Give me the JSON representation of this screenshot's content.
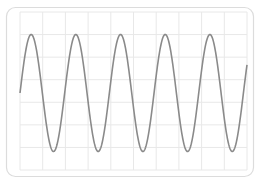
{
  "chart_data": {
    "type": "line",
    "title": "",
    "xlabel": "",
    "ylabel": "",
    "grid": true,
    "legend": null,
    "series": [
      {
        "name": "sine",
        "function": "sin",
        "cycles": 5.08,
        "amplitude": 1.0,
        "phase": 0
      }
    ],
    "xlim": [
      0,
      5.08
    ],
    "ylim": [
      -1.35,
      1.35
    ],
    "grid_divisions": {
      "x": 10,
      "y": 7
    }
  },
  "style": {
    "line_color": "#8a8a8a",
    "grid_color": "#e8e8e8",
    "frame_color": "#dcdcdc",
    "background": "#ffffff"
  }
}
